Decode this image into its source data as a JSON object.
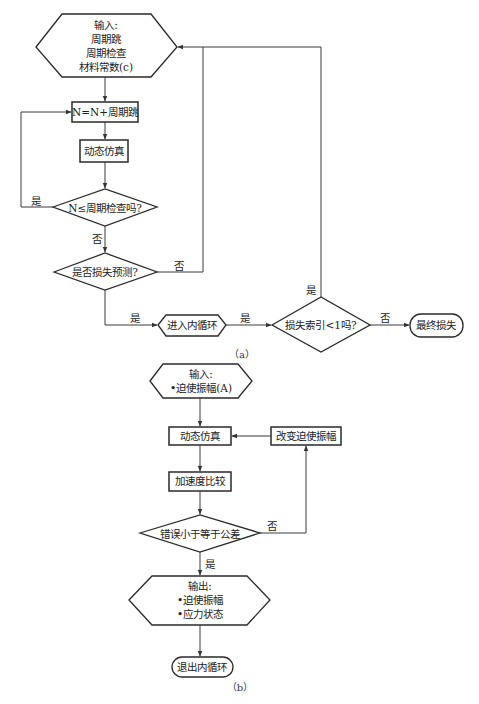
{
  "diagram_a": {
    "caption": "（a）",
    "input": {
      "title": "输入:",
      "lines": [
        "周期跳",
        "周期检查",
        "材料常数(c)"
      ]
    },
    "step_increment": "N=N+周期跳",
    "step_simulation": "动态仿真",
    "decision_cycle_check": "N≤周期检查吗?",
    "decision_damage_predict": "是否损失预测?",
    "enter_inner_loop": "进入内循环",
    "decision_damage_index": "损失索引<1吗?",
    "final_damage": "最终损失",
    "edges": {
      "cycle_check_yes": "是",
      "cycle_check_no": "否",
      "damage_predict_no": "否",
      "damage_predict_yes": "是",
      "inner_to_index_yes": "是",
      "damage_index_yes": "是",
      "damage_index_no": "否"
    }
  },
  "diagram_b": {
    "caption": "（b）",
    "input": {
      "title": "输入:",
      "lines": [
        "•迫使振幅(A)"
      ]
    },
    "step_simulation": "动态仿真",
    "step_change_amplitude": "改变迫使振幅",
    "step_accel_compare": "加速度比较",
    "decision_tolerance": "错误小于等于公差",
    "output": {
      "title": "输出:",
      "lines": [
        "•迫使振幅",
        "•应力状态"
      ]
    },
    "exit_inner_loop": "退出内循环",
    "edges": {
      "tolerance_no": "否",
      "tolerance_yes": "是"
    }
  }
}
